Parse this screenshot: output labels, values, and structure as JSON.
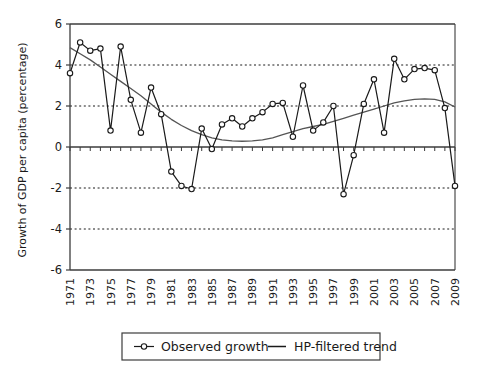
{
  "chart_data": {
    "type": "line",
    "title": "",
    "xlabel": "",
    "ylabel": "Growth of GDP per capita (percentage)",
    "ylim": [
      -6,
      6
    ],
    "yticks": [
      6,
      4,
      2,
      0,
      -2,
      -4,
      -6
    ],
    "ytick_labels": [
      "6",
      "4",
      "2",
      "0",
      "-2",
      "-4",
      "-6"
    ],
    "gridlines_dotted": [
      4,
      2,
      -2,
      -4
    ],
    "gridlines_solid": [
      0
    ],
    "grid": true,
    "legend_position": "bottom-center",
    "x": [
      1971,
      1972,
      1973,
      1974,
      1975,
      1976,
      1977,
      1978,
      1979,
      1980,
      1981,
      1982,
      1983,
      1984,
      1985,
      1986,
      1987,
      1988,
      1989,
      1990,
      1991,
      1992,
      1993,
      1994,
      1995,
      1996,
      1997,
      1998,
      1999,
      2000,
      2001,
      2002,
      2003,
      2004,
      2005,
      2006,
      2007,
      2008,
      2009
    ],
    "xtick_labels": [
      "1971",
      "1973",
      "1975",
      "1977",
      "1979",
      "1981",
      "1983",
      "1985",
      "1987",
      "1989",
      "1991",
      "1993",
      "1995",
      "1997",
      "1999",
      "2001",
      "2003",
      "2005",
      "2007",
      "2009"
    ],
    "series": [
      {
        "name": "Observed growth",
        "marker": "circle-open",
        "color": "#1a1a1a",
        "values": [
          3.6,
          5.1,
          4.7,
          4.8,
          0.8,
          4.9,
          2.3,
          0.7,
          2.9,
          1.6,
          -1.2,
          -1.9,
          -2.05,
          0.9,
          -0.1,
          1.1,
          1.4,
          1.0,
          1.4,
          1.7,
          2.1,
          2.15,
          0.5,
          3.0,
          0.8,
          1.2,
          2.0,
          -2.3,
          -0.4,
          2.1,
          3.3,
          0.7,
          4.3,
          3.3,
          3.8,
          3.85,
          3.75,
          1.9,
          -1.9
        ]
      },
      {
        "name": "HP-filtered trend",
        "marker": "none",
        "color": "#555555",
        "values": [
          4.85,
          4.55,
          4.25,
          3.9,
          3.55,
          3.2,
          2.85,
          2.5,
          2.1,
          1.7,
          1.35,
          1.05,
          0.8,
          0.6,
          0.45,
          0.35,
          0.3,
          0.28,
          0.3,
          0.35,
          0.45,
          0.6,
          0.75,
          0.9,
          1.0,
          1.1,
          1.25,
          1.4,
          1.55,
          1.7,
          1.85,
          2.0,
          2.15,
          2.25,
          2.32,
          2.35,
          2.32,
          2.2,
          1.95
        ]
      }
    ]
  },
  "legend": {
    "items": [
      {
        "label": "Observed growth",
        "style": "line-marker"
      },
      {
        "label": "HP-filtered trend",
        "style": "line"
      }
    ]
  }
}
